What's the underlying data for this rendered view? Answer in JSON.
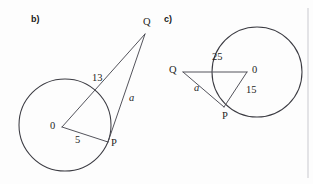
{
  "figure_set": {
    "background_color": "#fdfdfd",
    "ink_color": "#3b3b42",
    "divider_color": "#c9c9cf"
  },
  "panels": [
    {
      "key": "b",
      "label": "b)",
      "description": "Circle with center O, tangent segment from external point Q touching circle at P, and secant-like segment from O to Q",
      "circle": {
        "cx": 65,
        "cy": 125,
        "r": 46
      },
      "points": {
        "O": {
          "x": 62,
          "y": 127,
          "label": "0",
          "label_x": 50,
          "label_y": 121
        },
        "P": {
          "x": 108,
          "y": 142,
          "label": "P",
          "label_x": 111,
          "label_y": 138
        },
        "Q": {
          "x": 145,
          "y": 34,
          "label": "Q",
          "label_x": 143,
          "label_y": 17
        }
      },
      "measures": [
        {
          "name": "OQ",
          "value": "13",
          "x": 92,
          "y": 73,
          "italic": false
        },
        {
          "name": "QP",
          "value": "a",
          "x": 129,
          "y": 93,
          "italic": true
        },
        {
          "name": "OP",
          "value": "5",
          "x": 75,
          "y": 135,
          "italic": false
        }
      ]
    },
    {
      "key": "c",
      "label": "c)",
      "description": "Circle with center O, external point Q to the left, chord-like segment Q to O passing through circle, radius O to P, and tangent segment Q to P",
      "circle": {
        "cx": 257,
        "cy": 72,
        "r": 45
      },
      "points": {
        "O": {
          "x": 247,
          "y": 72,
          "label": "0",
          "label_x": 252,
          "label_y": 65
        },
        "P": {
          "x": 224,
          "y": 107,
          "label": "P",
          "label_x": 222,
          "label_y": 111
        },
        "Q": {
          "x": 183,
          "y": 72,
          "label": "Q",
          "label_x": 169,
          "label_y": 65
        }
      },
      "measures": [
        {
          "name": "QO",
          "value": "25",
          "x": 212,
          "y": 52,
          "italic": false
        },
        {
          "name": "OP",
          "value": "15",
          "x": 246,
          "y": 85,
          "italic": false
        },
        {
          "name": "QP",
          "value": "a",
          "x": 194,
          "y": 83,
          "italic": true
        }
      ]
    }
  ],
  "divider": {
    "x": 308,
    "y1": 8,
    "y2": 178
  }
}
